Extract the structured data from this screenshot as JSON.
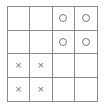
{
  "board": {
    "rows": 4,
    "cols": 4,
    "cells": [
      [
        "",
        "",
        "O",
        "O"
      ],
      [
        "",
        "",
        "O",
        "O"
      ],
      [
        "X",
        "X",
        "",
        ""
      ],
      [
        "X",
        "X",
        "",
        ""
      ]
    ]
  },
  "symbols": {
    "X": "×",
    "O": "o-ring"
  },
  "colors": {
    "grid": "#8a8a8a",
    "mark": "#777777",
    "background": "#ffffff"
  }
}
